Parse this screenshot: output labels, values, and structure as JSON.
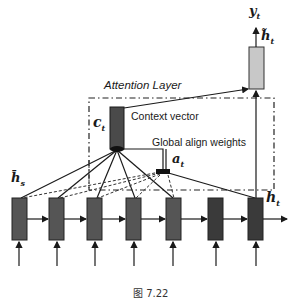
{
  "diagram": {
    "title": "Attention Layer",
    "labels": {
      "context_vector": "Context vector",
      "global_align_weights": "Global align weights",
      "c_t": "c",
      "c_t_sub": "t",
      "a_t": "a",
      "a_t_sub": "t",
      "h_s": "h̄",
      "h_s_sub": "s",
      "h_t": "h",
      "h_t_sub": "t",
      "y_t": "y",
      "y_t_sub": "t",
      "htilde_t": "h̃",
      "htilde_t_sub": "t"
    },
    "encoder_decoder_cells": 7,
    "colors": {
      "cell_fill": "#555555",
      "cell_dark": "#3a3a3a",
      "context_fill": "#4a4a4a",
      "output_fill": "#c8c8c8",
      "stroke": "#1a1a1a"
    }
  },
  "caption": "图 7.22"
}
